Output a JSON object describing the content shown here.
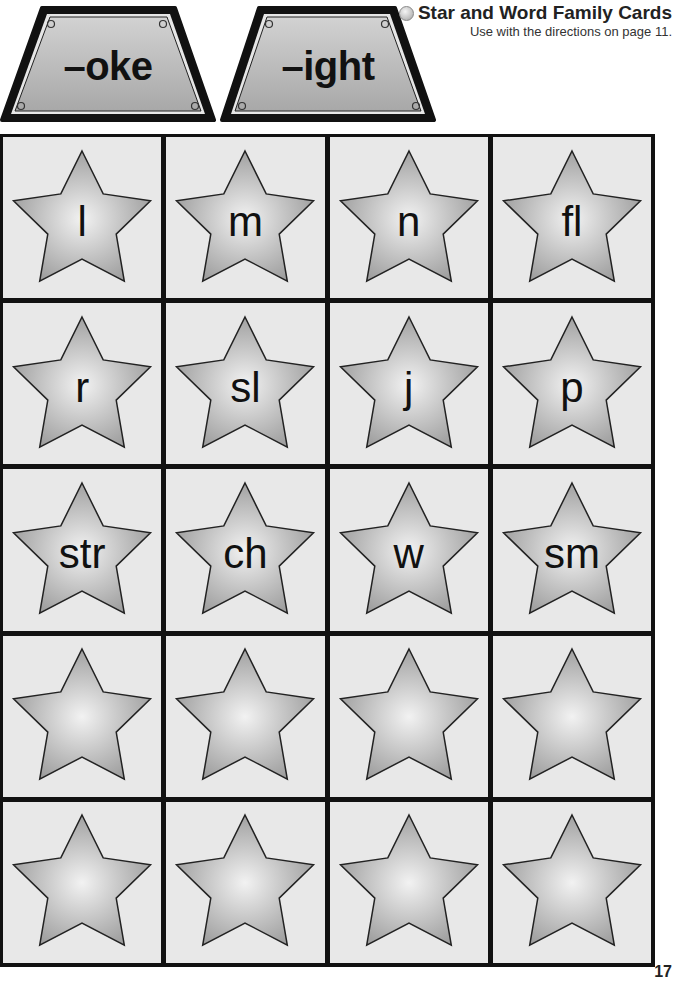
{
  "signs": [
    {
      "label": "–oke"
    },
    {
      "label": "–ight"
    }
  ],
  "header": {
    "bullet_icon": "circle-bullet-icon",
    "title": "Star and Word Family Cards",
    "subtitle": "Use with the directions on page 11."
  },
  "cards": [
    {
      "letter": "l"
    },
    {
      "letter": "m"
    },
    {
      "letter": "n"
    },
    {
      "letter": "fl"
    },
    {
      "letter": "r"
    },
    {
      "letter": "sl"
    },
    {
      "letter": "j"
    },
    {
      "letter": "p"
    },
    {
      "letter": "str"
    },
    {
      "letter": "ch"
    },
    {
      "letter": "w"
    },
    {
      "letter": "sm"
    },
    {
      "letter": ""
    },
    {
      "letter": ""
    },
    {
      "letter": ""
    },
    {
      "letter": ""
    },
    {
      "letter": ""
    },
    {
      "letter": ""
    },
    {
      "letter": ""
    },
    {
      "letter": ""
    }
  ],
  "colors": {
    "card_bg": "#e8e8e8",
    "grid_line": "#111111",
    "star_light": "#f2f2f2",
    "star_dark": "#9c9c9c",
    "sign_fill": "#b8b8b8"
  },
  "footer": {
    "page_number": "17"
  }
}
